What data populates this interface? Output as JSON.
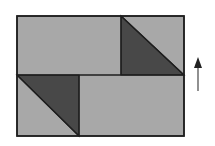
{
  "diagram": {
    "colors": {
      "background": "#ffffff",
      "light_fill": "#a8a8a8",
      "dark_fill": "#484848",
      "stroke": "#1e1e1e",
      "arrow": "#333333"
    },
    "outer_rect": {
      "x": 17,
      "y": 16,
      "w": 167,
      "h": 120
    },
    "top_row": {
      "divider_x": 121,
      "mid_y": 75,
      "dark_triangle": [
        [
          121,
          16
        ],
        [
          121,
          75
        ],
        [
          184,
          75
        ]
      ]
    },
    "bottom_row": {
      "divider_x": 79,
      "dark_triangle": [
        [
          17,
          75
        ],
        [
          79,
          75
        ],
        [
          79,
          136
        ]
      ]
    },
    "arrow": {
      "x": 198,
      "y_tip": 57,
      "y_tail": 91,
      "direction": "up"
    }
  }
}
